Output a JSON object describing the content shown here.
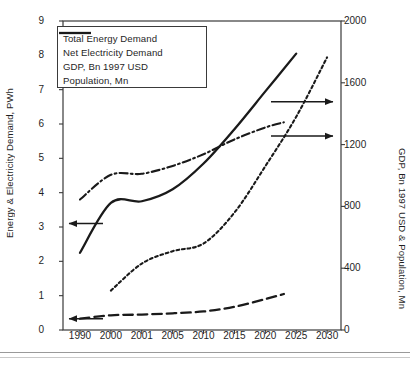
{
  "chart_data": {
    "type": "line",
    "title": "",
    "xlabel": "",
    "ylabel": "Energy & Electricity Demand, PWh",
    "y2label": "GDP, Bn 1997 USD & Population, Mn",
    "categories": [
      "1990",
      "2000",
      "2001",
      "2005",
      "2010",
      "2015",
      "2020",
      "2025",
      "2030"
    ],
    "ylim": [
      0,
      9
    ],
    "yticks": [
      "0",
      "1",
      "2",
      "3",
      "4",
      "5",
      "6",
      "7",
      "8",
      "9"
    ],
    "y2lim": [
      0,
      2000
    ],
    "y2ticks": [
      "0",
      "400",
      "800",
      "1200",
      "1600",
      "2000"
    ],
    "grid": false,
    "legend_position": "top-left",
    "series": [
      {
        "name": "Total Energy Demand",
        "axis": "left",
        "style": "solid",
        "unit": "PWh",
        "points": [
          {
            "x": "1990",
            "y": 2.25
          },
          {
            "x": "2000",
            "y": 3.7
          },
          {
            "x": "2001",
            "y": 3.75
          },
          {
            "x": "2005",
            "y": 4.1
          },
          {
            "x": "2010",
            "y": 4.85
          },
          {
            "x": "2015",
            "y": 5.85
          },
          {
            "x": "2020",
            "y": 6.95
          },
          {
            "x": "2025",
            "y": 8.05
          }
        ]
      },
      {
        "name": "Net Electricity Demand",
        "axis": "left",
        "style": "dash-dot",
        "unit": "PWh",
        "points": [
          {
            "x": "1990",
            "y": 3.8
          },
          {
            "x": "2000",
            "y": 4.52
          },
          {
            "x": "2001",
            "y": 4.55
          },
          {
            "x": "2005",
            "y": 4.78
          },
          {
            "x": "2010",
            "y": 5.12
          },
          {
            "x": "2015",
            "y": 5.55
          },
          {
            "x": "2020",
            "y": 5.9
          },
          {
            "x": "2023",
            "y": 6.05
          }
        ]
      },
      {
        "name": "GDP, Bn 1997 USD",
        "axis": "right",
        "style": "dotted",
        "unit": "Bn 1997 USD",
        "points": [
          {
            "x": "2000",
            "y": 255
          },
          {
            "x": "2001",
            "y": 430
          },
          {
            "x": "2005",
            "y": 510
          },
          {
            "x": "2010",
            "y": 560
          },
          {
            "x": "2015",
            "y": 760
          },
          {
            "x": "2020",
            "y": 1060
          },
          {
            "x": "2025",
            "y": 1380
          },
          {
            "x": "2030",
            "y": 1765
          }
        ]
      },
      {
        "name": "Population, Mn",
        "axis": "right",
        "style": "long-dash",
        "unit": "Mn",
        "points": [
          {
            "x": "1990",
            "y": 73
          },
          {
            "x": "2000",
            "y": 95
          },
          {
            "x": "2001",
            "y": 100
          },
          {
            "x": "2005",
            "y": 108
          },
          {
            "x": "2010",
            "y": 120
          },
          {
            "x": "2015",
            "y": 150
          },
          {
            "x": "2020",
            "y": 200
          },
          {
            "x": "2023",
            "y": 233
          }
        ]
      }
    ],
    "annotations": [
      {
        "name": "left-axis-arrow-total-energy",
        "direction": "left",
        "value": 3.1,
        "axis": "left"
      },
      {
        "name": "left-axis-arrow-population",
        "direction": "left",
        "value": 0.33,
        "axis": "left"
      },
      {
        "name": "right-axis-arrow-net-electricity",
        "direction": "right",
        "value": 5.65,
        "axis": "left"
      },
      {
        "name": "right-axis-arrow-gdp",
        "direction": "right",
        "value": 6.65,
        "axis": "left"
      }
    ]
  },
  "legend": {
    "items": [
      {
        "label": "Total Energy Demand"
      },
      {
        "label": "Net Electricity Demand"
      },
      {
        "label": "GDP, Bn 1997 USD"
      },
      {
        "label": "Population, Mn"
      }
    ]
  },
  "colors": {
    "line": "#1a1a1a",
    "axis": "#3a3a3a",
    "text": "#1f1f1f",
    "background": "#ffffff"
  }
}
